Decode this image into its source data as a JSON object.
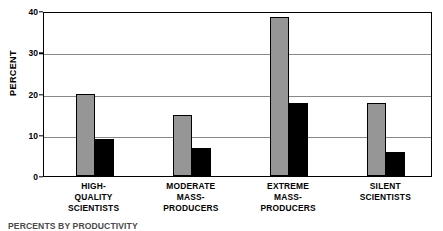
{
  "chart_data": {
    "type": "bar",
    "title": "",
    "subtitle": "",
    "xlabel": "",
    "ylabel": "PERCENT",
    "ylim": [
      0,
      40
    ],
    "yticks": [
      0,
      10,
      20,
      30,
      40
    ],
    "ytick_labels": [
      "0",
      "10",
      "20",
      "30",
      "40"
    ],
    "grid": true,
    "grid_axis": "y",
    "legend": false,
    "legend_position": "none",
    "categories": [
      "HIGH-\nQUALITY\nSCIENTISTS",
      "MODERATE\nMASS-\nPRODUCERS",
      "EXTREME\nMASS-\nPRODUCERS",
      "SILENT\nSCIENTISTS"
    ],
    "series": [
      {
        "name": "gray-series",
        "color": "#969696",
        "values": [
          20.0,
          14.7,
          38.5,
          17.6
        ]
      },
      {
        "name": "black-series",
        "color": "#000000",
        "values": [
          9.0,
          6.8,
          17.7,
          5.8
        ]
      }
    ]
  },
  "axis": {
    "y_title": "PERCENT"
  },
  "categories_display": [
    {
      "line1": "HIGH-",
      "line2": "QUALITY",
      "line3": "SCIENTISTS"
    },
    {
      "line1": "MODERATE",
      "line2": "MASS-",
      "line3": "PRODUCERS"
    },
    {
      "line1": "EXTREME",
      "line2": "MASS-",
      "line3": "PRODUCERS"
    },
    {
      "line1": "SILENT",
      "line2": "SCIENTISTS",
      "line3": ""
    }
  ],
  "caption": {
    "text": "PERCENTS BY PRODUCTIVITY"
  },
  "colors": {
    "series_gray": "#969696",
    "series_black": "#000000",
    "frame": "#000000",
    "gridline": "#888888",
    "background": "#ffffff"
  }
}
